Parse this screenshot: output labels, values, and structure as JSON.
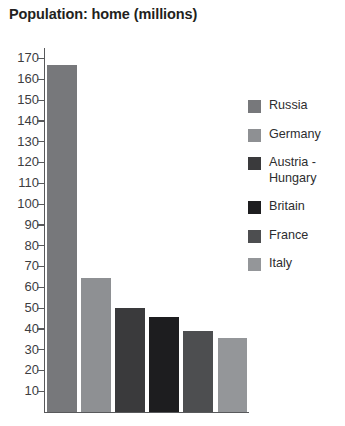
{
  "chart": {
    "title": "Population: home (millions)"
  },
  "legend": {
    "position": "right",
    "items": [
      {
        "label": "Russia",
        "color": "#77787b"
      },
      {
        "label": "Germany",
        "color": "#8e9093"
      },
      {
        "label": "Austria -\nHungary",
        "color": "#3a3a3c"
      },
      {
        "label": "Britain",
        "color": "#1d1d1f"
      },
      {
        "label": "France",
        "color": "#4d4e50"
      },
      {
        "label": "Italy",
        "color": "#949699"
      }
    ]
  },
  "axis": {
    "y_ticks": [
      170,
      160,
      150,
      140,
      130,
      120,
      110,
      100,
      90,
      80,
      70,
      60,
      50,
      40,
      30,
      20,
      10
    ]
  },
  "chart_data": {
    "type": "bar",
    "title": "Population: home (millions)",
    "xlabel": "",
    "ylabel": "",
    "categories": [
      "Russia",
      "Germany",
      "Austria - Hungary",
      "Britain",
      "France",
      "Italy"
    ],
    "values": [
      167,
      64.5,
      50,
      45.5,
      39,
      35.5
    ],
    "colors": [
      "#77787b",
      "#8e9093",
      "#3a3a3c",
      "#1d1d1f",
      "#4d4e50",
      "#949699"
    ],
    "ylim": [
      0,
      175
    ],
    "ytick_step": 10,
    "ytick_min": 10,
    "ytick_max": 170,
    "grid": false,
    "legend": [
      "Russia",
      "Germany",
      "Austria - Hungary",
      "Britain",
      "France",
      "Italy"
    ],
    "legend_position": "right"
  }
}
